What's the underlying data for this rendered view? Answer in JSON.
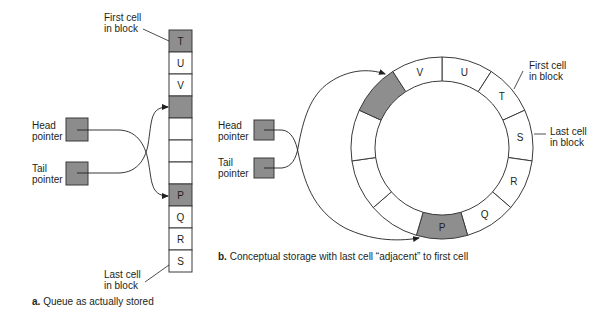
{
  "colors": {
    "stroke": "#3a3a3a",
    "shaded": "#8e8e8e",
    "pointer_fill": "#8c8c8c",
    "empty": "#ffffff"
  },
  "panel_a": {
    "caption_letter": "a.",
    "caption_text": "Queue as actually stored",
    "first_cell_label": [
      "First cell",
      "in block"
    ],
    "last_cell_label": [
      "Last cell",
      "in block"
    ],
    "head_label": [
      "Head",
      "pointer"
    ],
    "tail_label": [
      "Tail",
      "pointer"
    ],
    "cells": [
      {
        "label": "T",
        "shaded": true
      },
      {
        "label": "U",
        "shaded": false
      },
      {
        "label": "V",
        "shaded": false
      },
      {
        "label": "",
        "shaded": true
      },
      {
        "label": "",
        "shaded": false
      },
      {
        "label": "",
        "shaded": false
      },
      {
        "label": "",
        "shaded": false
      },
      {
        "label": "P",
        "shaded": true
      },
      {
        "label": "Q",
        "shaded": false
      },
      {
        "label": "R",
        "shaded": false
      },
      {
        "label": "S",
        "shaded": false
      }
    ]
  },
  "panel_b": {
    "caption_letter": "b.",
    "caption_text": "Conceptual storage with last cell “adjacent” to first cell",
    "first_cell_label": [
      "First cell",
      "in block"
    ],
    "last_cell_label": [
      "Last cell",
      "in block"
    ],
    "head_label": [
      "Head",
      "pointer"
    ],
    "tail_label": [
      "Tail",
      "pointer"
    ],
    "ring_cells_clockwise_from_top": [
      {
        "label": "U",
        "shaded": false
      },
      {
        "label": "T",
        "shaded": false
      },
      {
        "label": "S",
        "shaded": false
      },
      {
        "label": "R",
        "shaded": false
      },
      {
        "label": "Q",
        "shaded": false
      },
      {
        "label": "P",
        "shaded": true
      },
      {
        "label": "",
        "shaded": false
      },
      {
        "label": "",
        "shaded": false
      },
      {
        "label": "",
        "shaded": false
      },
      {
        "label": "",
        "shaded": true
      },
      {
        "label": "V",
        "shaded": false
      }
    ]
  }
}
